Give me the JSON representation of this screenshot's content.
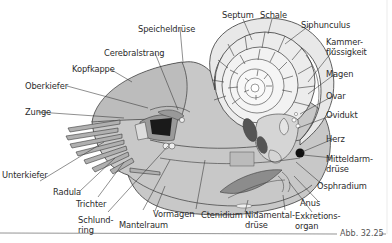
{
  "figure": {
    "caption": "Abb. 32.25",
    "colors": {
      "body": "#c9c9c9",
      "shell": "#e6e6e6",
      "line": "#3a3a3a",
      "dark": "#1a1a1a",
      "background": "#ffffff"
    }
  },
  "labels": {
    "septum": "Septum",
    "schale": "Schale",
    "siphunculus": "Siphunculus",
    "kammer1": "Kammer-",
    "kammer2": "flüssigkeit",
    "magen": "Magen",
    "ovar": "Ovar",
    "ovidukt": "Ovidukt",
    "herz": "Herz",
    "mittel1": "Mitteldarm-",
    "mittel2": "drüse",
    "osphradium": "Osphradium",
    "anus": "Anus",
    "exkr1": "Exkretions-",
    "exkr2": "organ",
    "nida1": "Nidamental-",
    "nida2": "drüse",
    "ctenidium": "Ctenidium",
    "vormagen": "Vormagen",
    "mantelraum": "Mantelraum",
    "schlund1": "Schlund-",
    "schlund2": "ring",
    "trichter": "Trichter",
    "radula": "Radula",
    "unterkiefer": "Unterkiefer",
    "zunge": "Zunge",
    "oberkiefer": "Oberkiefer",
    "kopfkappe": "Kopfkappe",
    "cerebralstrang": "Cerebralstrang",
    "speicheldruese": "Speicheldrüse"
  }
}
